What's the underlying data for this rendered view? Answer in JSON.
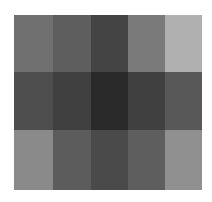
{
  "grid": {
    "rows": 3,
    "cols": 5,
    "cells": [
      [
        "#707070",
        "#5e5e5e",
        "#444444",
        "#7a7a7a",
        "#b0b0b0"
      ],
      [
        "#4e4e4e",
        "#404040",
        "#2a2a2a",
        "#404040",
        "#585858"
      ],
      [
        "#8a8a8a",
        "#5c5c5c",
        "#4a4a4a",
        "#5e5e5e",
        "#909090"
      ]
    ]
  }
}
